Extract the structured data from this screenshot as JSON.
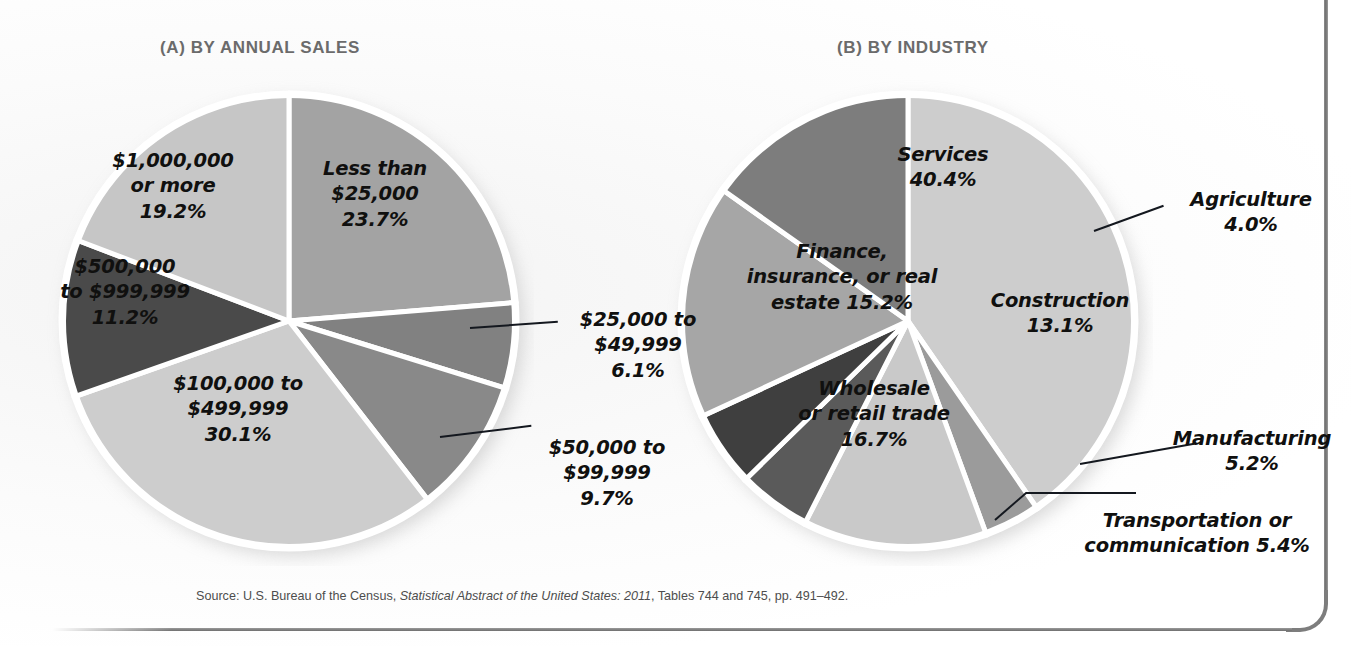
{
  "figure": {
    "panel_a_title": "(A) BY ANNUAL SALES",
    "panel_b_title": "(B) BY INDUSTRY",
    "source_prefix": "Source: U.S. Bureau of the Census, ",
    "source_italic": "Statistical Abstract of the United States: 2011",
    "source_suffix": ", Tables 744 and 745, pp. 491–492."
  },
  "chart_data": [
    {
      "type": "pie",
      "title": "(A) BY ANNUAL SALES",
      "legend": "none",
      "start_angle_deg": 0,
      "direction": "clockwise",
      "categories": [
        "Less than $25,000",
        "$25,000 to $49,999",
        "$50,000 to $99,999",
        "$100,000 to $499,999",
        "$500,000 to $999,999",
        "$1,000,000 or more"
      ],
      "values": [
        23.7,
        6.1,
        9.7,
        30.1,
        11.2,
        19.2
      ],
      "unit": "%",
      "colors": [
        "#a3a3a3",
        "#818181",
        "#898989",
        "#cdcdcd",
        "#4a4a4a",
        "#c6c6c6"
      ],
      "slice_labels": [
        {
          "text": "Less than\n$25,000\n23.7%",
          "placement": "inside"
        },
        {
          "text": "$25,000 to\n$49,999\n6.1%",
          "placement": "callout"
        },
        {
          "text": "$50,000 to\n$99,999\n9.7%",
          "placement": "callout"
        },
        {
          "text": "$100,000 to\n$499,999\n30.1%",
          "placement": "inside"
        },
        {
          "text": "$500,000\nto $999,999\n11.2%",
          "placement": "inside"
        },
        {
          "text": "$1,000,000\nor more\n19.2%",
          "placement": "inside"
        }
      ]
    },
    {
      "type": "pie",
      "title": "(B) BY INDUSTRY",
      "legend": "none",
      "start_angle_deg": 0,
      "direction": "clockwise",
      "categories": [
        "Services",
        "Agriculture",
        "Construction",
        "Manufacturing",
        "Transportation or communication",
        "Wholesale or retail trade",
        "Finance, insurance, or real estate"
      ],
      "values": [
        40.4,
        4.0,
        13.1,
        5.2,
        5.4,
        16.7,
        15.2
      ],
      "unit": "%",
      "colors": [
        "#cdcdcd",
        "#9b9b9b",
        "#c9c9c9",
        "#5a5a5a",
        "#3f3f3f",
        "#a6a6a6",
        "#7d7d7d"
      ],
      "slice_labels": [
        {
          "text": "Services\n40.4%",
          "placement": "inside"
        },
        {
          "text": "Agriculture\n4.0%",
          "placement": "callout"
        },
        {
          "text": "Construction\n13.1%",
          "placement": "inside"
        },
        {
          "text": "Manufacturing\n5.2%",
          "placement": "callout"
        },
        {
          "text": "Transportation or\ncommunication 5.4%",
          "placement": "callout"
        },
        {
          "text": "Wholesale\nor retail trade\n16.7%",
          "placement": "inside"
        },
        {
          "text": "Finance,\ninsurance, or real\nestate 15.2%",
          "placement": "inside"
        }
      ]
    }
  ]
}
